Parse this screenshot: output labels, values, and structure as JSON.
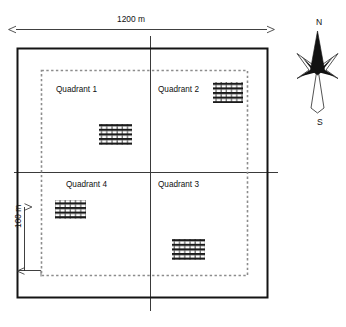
{
  "figure": {
    "type": "site-plan-diagram"
  },
  "dimensions": {
    "overall_width_label": "1200 m",
    "buffer_label": "100 m"
  },
  "quadrants": [
    {
      "id": "q1",
      "label": "Quadrant 1",
      "position": "top-left"
    },
    {
      "id": "q2",
      "label": "Quadrant 2",
      "position": "top-right"
    },
    {
      "id": "q3",
      "label": "Quadrant 3",
      "position": "bottom-right"
    },
    {
      "id": "q4",
      "label": "Quadrant 4",
      "position": "bottom-left"
    }
  ],
  "plots": [
    {
      "id": "plot-q1",
      "quadrant": "Quadrant 1"
    },
    {
      "id": "plot-q2",
      "quadrant": "Quadrant 2"
    },
    {
      "id": "plot-q3",
      "quadrant": "Quadrant 3"
    },
    {
      "id": "plot-q4",
      "quadrant": "Quadrant 4"
    }
  ],
  "compass": {
    "north_label": "N",
    "south_label": "S"
  },
  "colors": {
    "outline": "#1a1a1a",
    "inner_dashed": "#8c8c8c",
    "crosshair": "#3a3a3a",
    "hatch": "#1a1a1a",
    "background": "#ffffff"
  }
}
